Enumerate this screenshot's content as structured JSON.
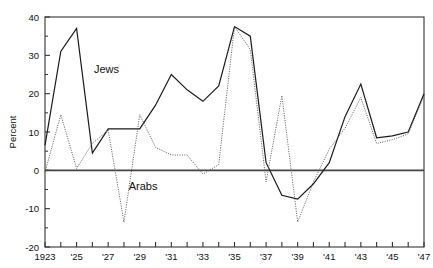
{
  "chart_data": {
    "type": "line",
    "title": "",
    "subtitle": "",
    "xlabel": "",
    "ylabel": "Percent",
    "xlim": [
      1923,
      1947
    ],
    "ylim": [
      -20,
      40
    ],
    "yticks": [
      -20,
      -10,
      0,
      10,
      20,
      30,
      40
    ],
    "ytick_labels": [
      "-20",
      "-10",
      "0",
      "10",
      "20",
      "30",
      "40"
    ],
    "x": [
      1923,
      1924,
      1925,
      1926,
      1927,
      1928,
      1929,
      1930,
      1931,
      1932,
      1933,
      1934,
      1935,
      1936,
      1937,
      1938,
      1939,
      1940,
      1941,
      1942,
      1943,
      1944,
      1945,
      1946,
      1947
    ],
    "xtick_values": [
      1923,
      1924,
      1925,
      1926,
      1927,
      1928,
      1929,
      1930,
      1931,
      1932,
      1933,
      1934,
      1935,
      1936,
      1937,
      1938,
      1939,
      1940,
      1941,
      1942,
      1943,
      1944,
      1945,
      1946,
      1947
    ],
    "xtick_labels": [
      "1923",
      "",
      "'25",
      "",
      "'27",
      "",
      "'29",
      "",
      "'31",
      "",
      "'33",
      "",
      "'35",
      "",
      "'37",
      "",
      "'39",
      "",
      "'41",
      "",
      "'43",
      "",
      "'45",
      "",
      "'47"
    ],
    "grid": false,
    "legend_position": "inline-annotation",
    "zero_line": true,
    "series": [
      {
        "name": "Jews",
        "style": "solid",
        "color": "#1a1a1a",
        "label_x": 1926.1,
        "label_y": 25.5,
        "values": [
          6.5,
          31.0,
          37.0,
          4.5,
          10.8,
          10.8,
          10.8,
          17.0,
          25.0,
          21.0,
          18.0,
          22.0,
          37.5,
          35.0,
          2.0,
          -6.5,
          -7.5,
          -3.5,
          2.0,
          14.0,
          22.5,
          8.5,
          9.0,
          10.0,
          20.0
        ]
      },
      {
        "name": "Arabs",
        "style": "dotted",
        "color": "#555555",
        "label_x": 1928.3,
        "label_y": -5.0,
        "values": [
          -0.5,
          14.5,
          0.5,
          7.0,
          10.5,
          -13.5,
          14.5,
          6.0,
          4.0,
          4.0,
          -1.0,
          1.5,
          37.5,
          31.5,
          -3.0,
          19.5,
          -13.5,
          -3.0,
          5.5,
          11.0,
          19.0,
          7.0,
          8.0,
          9.5,
          19.5
        ]
      }
    ],
    "annotations": [
      {
        "text": "Jews",
        "series": "Jews"
      },
      {
        "text": "Arabs",
        "series": "Arabs"
      }
    ]
  },
  "axes": {
    "ylabel": "Percent",
    "frame_color": "#333333"
  }
}
